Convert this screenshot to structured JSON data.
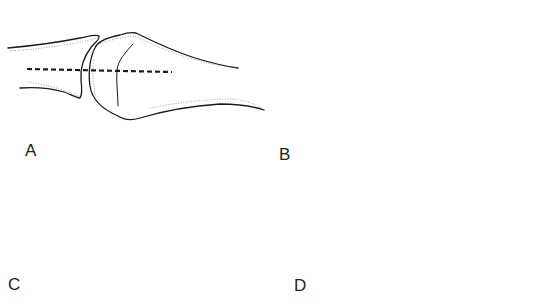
{
  "figure": {
    "type": "anatomical-joint-alignment-diagram",
    "panels": [
      {
        "id": "A",
        "label": "A",
        "description": "Congruent joint: proximal phalanx base and metacarpal head aligned along a common dashed axis"
      },
      {
        "id": "B",
        "label": "B",
        "description": "Dislocated joint: proximal phalanx displaced below the metacarpal head axis"
      },
      {
        "id": "C",
        "label": "C",
        "description": "Subluxated joint: phalanx base riding up at the level of the dashed axis"
      },
      {
        "id": "D",
        "label": "D",
        "description": "Joint with interposed volar plate / small fragment within the joint space"
      }
    ],
    "colors": {
      "line": "#1a1a1a",
      "hatching": "#8a8a8a",
      "background": "#ffffff"
    }
  }
}
